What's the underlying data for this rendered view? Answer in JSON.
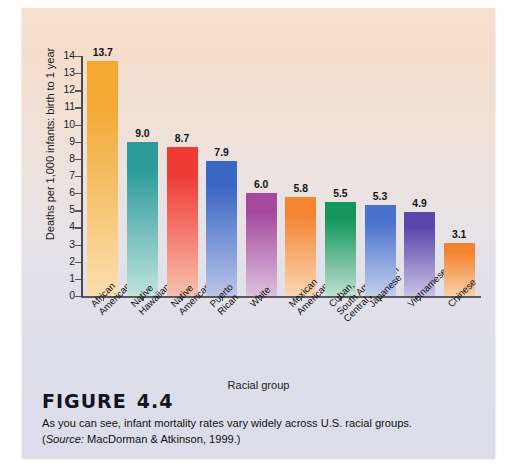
{
  "figure": {
    "number_label": "FIGURE",
    "number": "4.4",
    "caption": "As you can see, infant mortality rates vary widely across U.S. racial groups.",
    "source_prefix": "Source:",
    "source_text": " MacDorman & Atkinson, 1999.)",
    "source_open_paren": "("
  },
  "chart_data": {
    "type": "bar",
    "title": "",
    "xlabel": "Racial group",
    "ylabel": "Deaths per 1,000 infants: birth to 1 year",
    "ylim": [
      0,
      14
    ],
    "yticks": [
      0,
      1,
      2,
      3,
      4,
      5,
      6,
      7,
      8,
      9,
      10,
      11,
      12,
      13,
      14
    ],
    "ytick_labels": [
      "0",
      "1",
      "2",
      "3",
      "4",
      "5",
      "6",
      "7",
      "8",
      "9",
      "10",
      "11",
      "12",
      "13",
      "14"
    ],
    "grid": false,
    "legend": "none",
    "categories": [
      "African American",
      "Native Hawaiian",
      "Native American",
      "Puerto Rican",
      "White",
      "Mexican American",
      "Cuban, South American, Central American",
      "Japanese",
      "Vietnamese",
      "Chinese"
    ],
    "category_lines": [
      [
        "African",
        "American"
      ],
      [
        "Native",
        "Hawaiian"
      ],
      [
        "Native",
        "American"
      ],
      [
        "Puerto",
        "Rican"
      ],
      [
        "White"
      ],
      [
        "Mexican",
        "American"
      ],
      [
        "Cuban,",
        "South American,",
        "Central American"
      ],
      [
        "Japanese"
      ],
      [
        "Vietnamese"
      ],
      [
        "Chinese"
      ]
    ],
    "values": [
      13.7,
      9.0,
      8.7,
      7.9,
      6.0,
      5.8,
      5.5,
      5.3,
      4.9,
      3.1
    ],
    "value_labels": [
      "13.7",
      "9.0",
      "8.7",
      "7.9",
      "6.0",
      "5.8",
      "5.5",
      "5.3",
      "4.9",
      "3.1"
    ],
    "bar_colors": [
      "#f2a833",
      "#2e9b9b",
      "#ee3b33",
      "#3a66c4",
      "#a4499e",
      "#f58433",
      "#13965c",
      "#4a72cd",
      "#5a46ac",
      "#f3842f"
    ],
    "bar_colors_bottom": [
      "#fbdfae",
      "#bfe3dc",
      "#f9bfae",
      "#b9c4e8",
      "#dcc0de",
      "#fbd6b4",
      "#bfe0cf",
      "#c3cfee",
      "#c9c2e6",
      "#fad0ab"
    ]
  },
  "colors": {
    "panel_top": "#f7e0cd",
    "panel_bottom": "#dcdcea",
    "axis": "#4a4a4a",
    "text": "#141414"
  }
}
